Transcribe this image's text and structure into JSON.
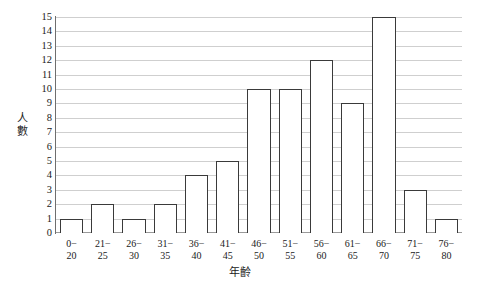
{
  "chart_data": {
    "type": "bar",
    "title": "",
    "subtitle": "",
    "xlabel": "年齡",
    "ylabel": "人數",
    "categories": [
      "0-\n20",
      "21-\n25",
      "26-\n30",
      "31-\n35",
      "36-\n40",
      "41-\n45",
      "46-\n50",
      "51-\n55",
      "56-\n60",
      "61-\n65",
      "66-\n70",
      "71-\n75",
      "76-\n80"
    ],
    "category_lines": [
      [
        "0−",
        "20"
      ],
      [
        "21−",
        "25"
      ],
      [
        "26−",
        "30"
      ],
      [
        "31−",
        "35"
      ],
      [
        "36−",
        "40"
      ],
      [
        "41−",
        "45"
      ],
      [
        "46−",
        "50"
      ],
      [
        "51−",
        "55"
      ],
      [
        "56−",
        "60"
      ],
      [
        "61−",
        "65"
      ],
      [
        "66−",
        "70"
      ],
      [
        "71−",
        "75"
      ],
      [
        "76−",
        "80"
      ]
    ],
    "values": [
      1,
      2,
      1,
      2,
      4,
      5,
      10,
      10,
      12,
      9,
      15,
      3,
      1
    ],
    "ylim": [
      0,
      15
    ],
    "ytick_labels": [
      "0",
      "1",
      "2",
      "3",
      "4",
      "5",
      "6",
      "7",
      "8",
      "9",
      "10",
      "11",
      "12",
      "13",
      "14",
      "15"
    ],
    "ytick_values": [
      0,
      1,
      2,
      3,
      4,
      5,
      6,
      7,
      8,
      9,
      10,
      11,
      12,
      13,
      14,
      15
    ],
    "grid": true,
    "grid_axis": "y",
    "legend": false,
    "legend_position": "none",
    "bar_fill_color": "#ffffff",
    "bar_edge_color": "#3a3a3a",
    "gridline_color": "#cfcfcf",
    "axis_color": "#6e6e6e",
    "text_color": "#1a1a1a"
  },
  "ylabel_chars": [
    "人",
    "數"
  ]
}
